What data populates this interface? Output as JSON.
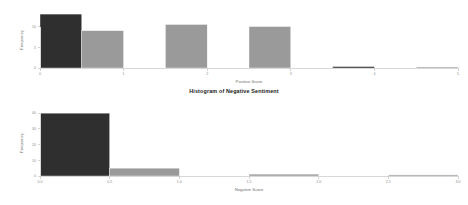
{
  "figure": {
    "background_color": "#ffffff",
    "width": 468,
    "height": 205
  },
  "titles": {
    "bottom_chart": "Histogram of Negative Sentiment"
  },
  "colors": {
    "dark_bar": "#2f2f2f",
    "gray_bar": "#9a9a9a",
    "axis": "#d8d8d8",
    "tick_text": "#8a8a8a",
    "axis_title": "#6f6f6f",
    "title_text": "#1a1a1a"
  },
  "chart_data": [
    {
      "id": "positive-sentiment-histogram",
      "type": "bar",
      "title": "",
      "xlabel": "Positive Score",
      "ylabel": "Frequency",
      "xlim": [
        0,
        5
      ],
      "ylim": [
        0,
        13.5
      ],
      "xticks": [
        "0",
        "1",
        "2",
        "3",
        "4",
        "5"
      ],
      "xtick_values": [
        0,
        1,
        2,
        3,
        4,
        5
      ],
      "yticks": [
        "0",
        "5",
        "10"
      ],
      "ytick_values": [
        0,
        5,
        10
      ],
      "grid": false,
      "legend": null,
      "bin_width": 0.5,
      "bars": [
        {
          "bin_start": 0.0,
          "bin_end": 0.5,
          "value": 13,
          "color": "#2f2f2f"
        },
        {
          "bin_start": 0.5,
          "bin_end": 1.0,
          "value": 9,
          "color": "#9a9a9a"
        },
        {
          "bin_start": 1.0,
          "bin_end": 1.5,
          "value": 0,
          "color": "#9a9a9a"
        },
        {
          "bin_start": 1.5,
          "bin_end": 2.0,
          "value": 10.5,
          "color": "#9a9a9a"
        },
        {
          "bin_start": 2.0,
          "bin_end": 2.5,
          "value": 0,
          "color": "#9a9a9a"
        },
        {
          "bin_start": 2.5,
          "bin_end": 3.0,
          "value": 10,
          "color": "#9a9a9a"
        },
        {
          "bin_start": 3.0,
          "bin_end": 3.5,
          "value": 0,
          "color": "#9a9a9a"
        },
        {
          "bin_start": 3.5,
          "bin_end": 4.0,
          "value": 0.35,
          "color": "#2f2f2f"
        },
        {
          "bin_start": 4.0,
          "bin_end": 4.5,
          "value": 0,
          "color": "#9a9a9a"
        },
        {
          "bin_start": 4.5,
          "bin_end": 5.0,
          "value": 0.25,
          "color": "#9a9a9a"
        }
      ]
    },
    {
      "id": "negative-sentiment-histogram",
      "type": "bar",
      "title": "Histogram of Negative Sentiment",
      "xlabel": "Negative Score",
      "ylabel": "Frequency",
      "xlim": [
        0,
        3
      ],
      "ylim": [
        0,
        42
      ],
      "xticks": [
        "0.0",
        "0.5",
        "1.0",
        "1.5",
        "2.0",
        "2.5",
        "3.0"
      ],
      "xtick_values": [
        0.0,
        0.5,
        1.0,
        1.5,
        2.0,
        2.5,
        3.0
      ],
      "yticks": [
        "0",
        "10",
        "20",
        "30",
        "40"
      ],
      "ytick_values": [
        0,
        10,
        20,
        30,
        40
      ],
      "grid": false,
      "legend": null,
      "bin_width": 0.25,
      "bars": [
        {
          "bin_start": 0.0,
          "bin_end": 0.5,
          "value": 40,
          "color": "#2f2f2f"
        },
        {
          "bin_start": 0.5,
          "bin_end": 1.0,
          "value": 5,
          "color": "#9a9a9a"
        },
        {
          "bin_start": 1.0,
          "bin_end": 1.5,
          "value": 0,
          "color": "#9a9a9a"
        },
        {
          "bin_start": 1.5,
          "bin_end": 2.0,
          "value": 1.2,
          "color": "#9a9a9a"
        },
        {
          "bin_start": 2.0,
          "bin_end": 2.5,
          "value": 0,
          "color": "#9a9a9a"
        },
        {
          "bin_start": 2.5,
          "bin_end": 3.0,
          "value": 0.7,
          "color": "#9a9a9a"
        }
      ]
    }
  ]
}
